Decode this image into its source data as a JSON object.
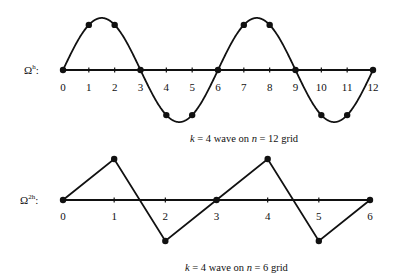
{
  "chart_data": [
    {
      "type": "line",
      "title": "k = 4 wave on n = 12 grid",
      "grid_label": "Ω^h:",
      "x_ticks": [
        "0",
        "1",
        "2",
        "3",
        "4",
        "5",
        "6",
        "7",
        "8",
        "9",
        "10",
        "11",
        "12"
      ],
      "x": [
        0,
        1,
        2,
        3,
        4,
        5,
        6,
        7,
        8,
        9,
        10,
        11,
        12
      ],
      "values": [
        0,
        0.866,
        0.866,
        0,
        -0.866,
        -0.866,
        0,
        0.866,
        0.866,
        0,
        -0.866,
        -0.866,
        0
      ],
      "curve": "sin(k*pi*x/n), k=4, n=12 (smooth)",
      "points_marked": true
    },
    {
      "type": "line",
      "title": "k = 4 wave on n = 6 grid",
      "grid_label": "Ω^2h:",
      "x_ticks": [
        "0",
        "1",
        "2",
        "3",
        "4",
        "5",
        "6"
      ],
      "x": [
        0,
        1,
        2,
        3,
        4,
        5,
        6
      ],
      "values": [
        0,
        0.866,
        -0.866,
        0,
        0.866,
        -0.866,
        0
      ],
      "curve": "piecewise linear interpolation",
      "points_marked": true
    }
  ],
  "top": {
    "label_main": "Ω",
    "label_sup": "h",
    "label_colon": ":",
    "caption": {
      "k": "k",
      "eq1": " = 4 wave on ",
      "n": "n",
      "eq2": " = 12 grid"
    }
  },
  "bottom": {
    "label_main": "Ω",
    "label_sup": "2h",
    "label_colon": ":",
    "caption": {
      "k": "k",
      "eq1": " = 4 wave on ",
      "n": "n",
      "eq2": " = 6 grid"
    }
  }
}
